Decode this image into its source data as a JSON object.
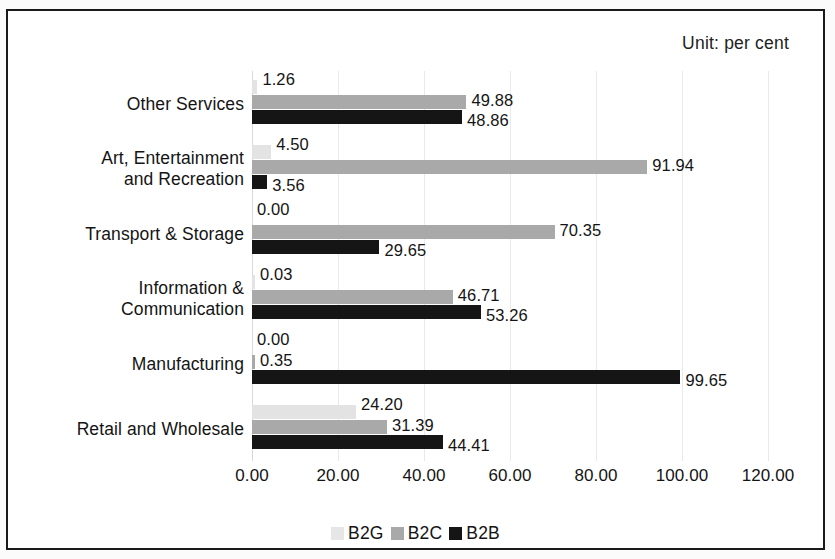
{
  "annotation": {
    "unit_note": "Unit: per cent"
  },
  "legend": {
    "items": [
      {
        "label": "B2G",
        "color": "#e6e6e6"
      },
      {
        "label": "B2C",
        "color": "#a9a9a9"
      },
      {
        "label": "B2B",
        "color": "#151515"
      }
    ]
  },
  "axis": {
    "tick_labels": [
      "0.00",
      "20.00",
      "40.00",
      "60.00",
      "80.00",
      "100.00",
      "120.00"
    ]
  },
  "chart_data": {
    "type": "bar",
    "orientation": "horizontal",
    "title": "",
    "subtitle": "",
    "annotations": [
      "Unit: per cent"
    ],
    "xlabel": "",
    "ylabel": "",
    "xlim": [
      0,
      120
    ],
    "xticks": [
      0,
      20,
      40,
      60,
      80,
      100,
      120
    ],
    "xtick_labels": [
      "0.00",
      "20.00",
      "40.00",
      "60.00",
      "80.00",
      "100.00",
      "120.00"
    ],
    "grid": true,
    "grid_axis": "x",
    "legend_position": "bottom",
    "categories": [
      "Other Services",
      "Art, Entertainment\nand Recreation",
      "Transport & Storage",
      "Information &\nCommunication",
      "Manufacturing",
      "Retail and Wholesale"
    ],
    "series": [
      {
        "name": "B2G",
        "color": "#e3e3e3",
        "values": [
          1.26,
          4.5,
          0.0,
          0.03,
          0.0,
          24.2
        ],
        "labels": [
          "1.26",
          "4.50",
          "0.00",
          "0.03",
          "0.00",
          "24.20"
        ]
      },
      {
        "name": "B2C",
        "color": "#a9a9a9",
        "values": [
          49.88,
          91.94,
          70.35,
          46.71,
          0.35,
          31.39
        ],
        "labels": [
          "49.88",
          "91.94",
          "70.35",
          "46.71",
          "0.35",
          "31.39"
        ]
      },
      {
        "name": "B2B",
        "color": "#151515",
        "values": [
          48.86,
          3.56,
          29.65,
          53.26,
          99.65,
          44.41
        ],
        "labels": [
          "48.86",
          "3.56",
          "29.65",
          "53.26",
          "99.65",
          "44.41"
        ]
      }
    ]
  }
}
